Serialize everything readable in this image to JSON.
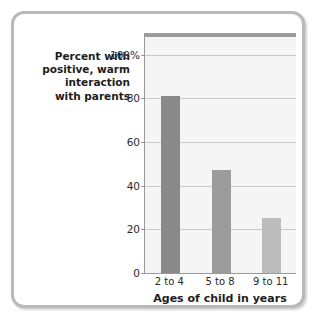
{
  "chart_data": {
    "type": "bar",
    "title": "",
    "categories": [
      "2 to 4",
      "5 to 8",
      "9 to 11"
    ],
    "values": [
      81,
      47,
      25
    ],
    "series": [
      {
        "name": "Percent with positive, warm interaction with parents",
        "values": [
          81,
          47,
          25
        ]
      }
    ],
    "ylabel": "Percent with positive, warm interaction with parents",
    "ylabel_lines": [
      "Percent with",
      "positive, warm",
      "interaction",
      "with parents"
    ],
    "xlabel": "Ages of child in years",
    "ylim": [
      0,
      110
    ],
    "yticks": [
      0,
      20,
      40,
      60,
      80,
      100
    ],
    "ytick_labels": [
      "0",
      "20",
      "40",
      "60",
      "80",
      "100%"
    ],
    "grid": true,
    "legend": false,
    "bar_colors": [
      "#8a8a8a",
      "#9c9c9c",
      "#bcbcbc"
    ],
    "plot_background": "#f5f5f5",
    "gridline_color": "#c8c8c8",
    "axis_color": "#9a9a9a",
    "frame_color": "#b9b9b9"
  }
}
